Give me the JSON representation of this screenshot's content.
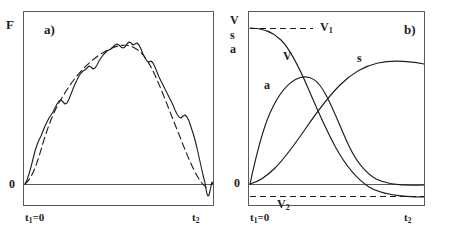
{
  "figure": {
    "title": "",
    "panels": [
      {
        "id": "a",
        "label": "a)",
        "y_axis_label": "F",
        "y_zero_label": "0",
        "x_start_label": "t<sub>1</sub>=0",
        "x_start_text": "t1=0",
        "x_end_label": "t<sub>2</sub>",
        "x_end_text": "t2",
        "curves": [
          {
            "name": "measured-force",
            "style": "solid",
            "label": ""
          },
          {
            "name": "smoothed-force",
            "style": "dashed",
            "label": ""
          }
        ]
      },
      {
        "id": "b",
        "label": "b)",
        "y_axis_label_lines": [
          "V",
          "s",
          "a"
        ],
        "y_zero_label": "0",
        "x_start_label": "t<sub>1</sub>=0",
        "x_start_text": "t1=0",
        "x_end_label": "t<sub>2</sub>",
        "x_end_text": "t2",
        "reference_lines": [
          {
            "name": "v1-line",
            "label": "V1",
            "label_html": "V<sub>1</sub>",
            "style": "dashed",
            "position": "top"
          },
          {
            "name": "v2-line",
            "label": "V2",
            "label_html": "V<sub>2</sub>",
            "style": "dashed",
            "position": "below-zero"
          }
        ],
        "curves": [
          {
            "name": "velocity-curve",
            "label": "V",
            "style": "solid"
          },
          {
            "name": "acceleration-curve",
            "label": "a",
            "style": "solid"
          },
          {
            "name": "displacement-curve",
            "label": "s",
            "style": "solid"
          }
        ]
      }
    ]
  },
  "chart_data": [
    {
      "type": "line",
      "panel": "a",
      "title": "a)",
      "xlabel": "",
      "ylabel": "F",
      "xtick_labels": [
        "t1=0",
        "t2"
      ],
      "ytick_labels": [
        "0"
      ],
      "grid": false,
      "legend": "none",
      "xlim": [
        0,
        1
      ],
      "ylim": [
        -0.12,
        1.05
      ],
      "series": [
        {
          "name": "measured force (solid, noisy)",
          "style": "solid",
          "x": [
            0.0,
            0.02,
            0.04,
            0.06,
            0.08,
            0.1,
            0.12,
            0.14,
            0.16,
            0.18,
            0.2,
            0.22,
            0.24,
            0.26,
            0.28,
            0.3,
            0.32,
            0.34,
            0.36,
            0.38,
            0.4,
            0.42,
            0.44,
            0.46,
            0.48,
            0.5,
            0.52,
            0.54,
            0.56,
            0.58,
            0.6,
            0.62,
            0.64,
            0.66,
            0.68,
            0.7,
            0.72,
            0.74,
            0.76,
            0.78,
            0.8,
            0.82,
            0.84,
            0.86,
            0.88,
            0.9,
            0.92,
            0.94,
            0.96,
            0.98,
            1.0
          ],
          "y": [
            0.0,
            0.04,
            0.1,
            0.17,
            0.24,
            0.3,
            0.33,
            0.31,
            0.34,
            0.42,
            0.5,
            0.57,
            0.62,
            0.6,
            0.63,
            0.7,
            0.74,
            0.72,
            0.76,
            0.8,
            0.84,
            0.85,
            0.82,
            0.85,
            0.88,
            0.86,
            0.82,
            0.86,
            0.84,
            0.78,
            0.72,
            0.7,
            0.66,
            0.62,
            0.58,
            0.52,
            0.46,
            0.42,
            0.44,
            0.4,
            0.33,
            0.27,
            0.22,
            0.24,
            0.22,
            0.16,
            0.08,
            0.0,
            -0.07,
            -0.09,
            -0.05
          ]
        },
        {
          "name": "smoothed force (dashed)",
          "style": "dashed",
          "x": [
            0.0,
            0.05,
            0.1,
            0.15,
            0.2,
            0.25,
            0.3,
            0.35,
            0.4,
            0.45,
            0.5,
            0.55,
            0.6,
            0.65,
            0.7,
            0.75,
            0.8,
            0.85,
            0.9,
            0.95,
            1.0
          ],
          "y": [
            0.0,
            0.13,
            0.3,
            0.4,
            0.52,
            0.62,
            0.71,
            0.78,
            0.83,
            0.86,
            0.86,
            0.84,
            0.75,
            0.65,
            0.54,
            0.44,
            0.34,
            0.24,
            0.14,
            0.05,
            -0.02
          ]
        }
      ]
    },
    {
      "type": "line",
      "panel": "b",
      "title": "b)",
      "xlabel": "",
      "ylabel": "V s a",
      "xtick_labels": [
        "t1=0",
        "t2"
      ],
      "ytick_labels": [
        "0"
      ],
      "grid": false,
      "legend": "inline-labels",
      "xlim": [
        0,
        1
      ],
      "ylim": [
        -0.16,
        1.05
      ],
      "reference_values": {
        "V1": 0.92,
        "V2": -0.1,
        "zero": 0.0
      },
      "series": [
        {
          "name": "V",
          "label": "V",
          "style": "solid",
          "x": [
            0.0,
            0.05,
            0.1,
            0.15,
            0.2,
            0.25,
            0.3,
            0.35,
            0.4,
            0.45,
            0.5,
            0.55,
            0.6,
            0.65,
            0.7,
            0.75,
            0.8,
            0.85,
            0.9,
            0.95,
            1.0
          ],
          "y": [
            0.92,
            0.915,
            0.9,
            0.875,
            0.84,
            0.79,
            0.73,
            0.65,
            0.56,
            0.47,
            0.38,
            0.28,
            0.19,
            0.11,
            0.04,
            -0.01,
            -0.05,
            -0.075,
            -0.09,
            -0.098,
            -0.1
          ]
        },
        {
          "name": "a",
          "label": "a",
          "style": "solid",
          "x": [
            0.0,
            0.05,
            0.1,
            0.15,
            0.2,
            0.25,
            0.3,
            0.35,
            0.4,
            0.45,
            0.5,
            0.55,
            0.6,
            0.65,
            0.7,
            0.75,
            0.8,
            0.85,
            0.9,
            0.95,
            1.0
          ],
          "y": [
            0.0,
            0.3,
            0.5,
            0.62,
            0.68,
            0.7,
            0.685,
            0.65,
            0.6,
            0.53,
            0.45,
            0.37,
            0.29,
            0.22,
            0.16,
            0.11,
            0.07,
            0.045,
            0.025,
            0.012,
            0.005
          ]
        },
        {
          "name": "s",
          "label": "s",
          "style": "solid",
          "x": [
            0.0,
            0.05,
            0.1,
            0.15,
            0.2,
            0.25,
            0.3,
            0.35,
            0.4,
            0.45,
            0.5,
            0.55,
            0.6,
            0.65,
            0.7,
            0.75,
            0.8,
            0.85,
            0.9,
            0.95,
            1.0
          ],
          "y": [
            0.0,
            0.04,
            0.1,
            0.18,
            0.27,
            0.36,
            0.45,
            0.53,
            0.6,
            0.66,
            0.7,
            0.735,
            0.755,
            0.765,
            0.77,
            0.77,
            0.765,
            0.76,
            0.755,
            0.75,
            0.745
          ]
        }
      ]
    }
  ]
}
